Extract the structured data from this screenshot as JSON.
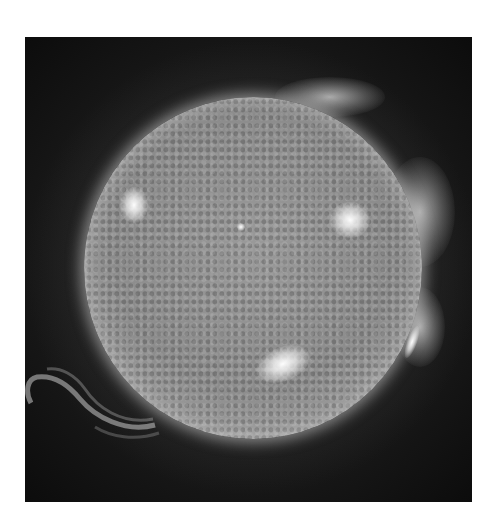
{
  "image": {
    "subject": "sun",
    "description": "Extreme ultraviolet image of the solar disc with bright active regions and a large prominence on the lower-left limb",
    "background_color": "#ffffff",
    "frame_color": "#141414",
    "disc_color": "#8c8c8c",
    "highlight_color": "#ffffff",
    "features": [
      {
        "name": "active-region-west-upper",
        "label": "bright active region (upper right)"
      },
      {
        "name": "active-region-east",
        "label": "bright active region (left)"
      },
      {
        "name": "active-region-south",
        "label": "bright active region (lower center)"
      },
      {
        "name": "prominence-southeast",
        "label": "loop prominence (lower left limb)"
      },
      {
        "name": "coronal-glow-west",
        "label": "coronal glow (right limb)"
      }
    ]
  }
}
